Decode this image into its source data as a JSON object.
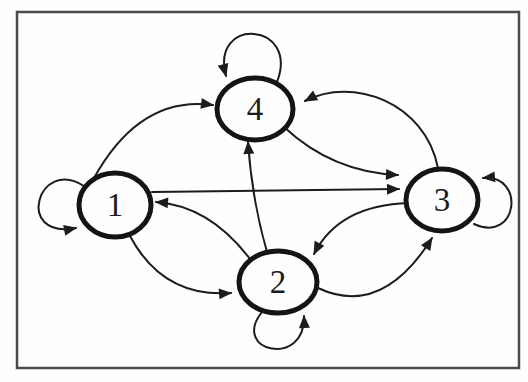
{
  "diagram": {
    "ink_color": "#1c1c1c",
    "node_stroke_color": "#141414",
    "node_fill_color": "#fefefe",
    "frame_color": "#4a4a4a",
    "background_color": "#fefefe",
    "frame": {
      "x": 17,
      "y": 12,
      "width": 502,
      "height": 356
    },
    "nodes": [
      {
        "id": "1",
        "label": "1",
        "cx": 115,
        "cy": 205,
        "rx": 36,
        "ry": 32
      },
      {
        "id": "2",
        "label": "2",
        "cx": 278,
        "cy": 282,
        "rx": 39,
        "ry": 31
      },
      {
        "id": "3",
        "label": "3",
        "cx": 442,
        "cy": 200,
        "rx": 36,
        "ry": 31
      },
      {
        "id": "4",
        "label": "4",
        "cx": 255,
        "cy": 109,
        "rx": 38,
        "ry": 31
      }
    ],
    "edges": [
      {
        "from": "1",
        "to": "1",
        "type": "self-loop",
        "d": "M 84 186 C 38 156, 14 240, 76 228"
      },
      {
        "from": "2",
        "to": "2",
        "type": "self-loop",
        "d": "M 262 312 C 230 352, 306 368, 304 316"
      },
      {
        "from": "3",
        "to": "3",
        "type": "self-loop",
        "d": "M 474 224 C 518 244, 526 174, 483 178"
      },
      {
        "from": "4",
        "to": "4",
        "type": "self-loop",
        "d": "M 277 82 C 300 22, 210 16, 226 76"
      },
      {
        "from": "1",
        "to": "4",
        "type": "arc",
        "d": "M 94 178 Q 140 95, 213 105"
      },
      {
        "from": "1",
        "to": "3",
        "type": "line",
        "d": "M 152 192 L 399 189"
      },
      {
        "from": "1",
        "to": "2",
        "type": "arc",
        "d": "M 130 236 Q 163 298, 231 293"
      },
      {
        "from": "2",
        "to": "1",
        "type": "arc",
        "d": "M 250 259 Q 210 206, 156 202"
      },
      {
        "from": "2",
        "to": "4",
        "type": "arc",
        "d": "M 267 252 Q 252 200, 248 142"
      },
      {
        "from": "2",
        "to": "3",
        "type": "arc",
        "d": "M 318 288 Q 382 318, 432 238"
      },
      {
        "from": "3",
        "to": "2",
        "type": "arc",
        "d": "M 409 203 Q 339 205, 314 254"
      },
      {
        "from": "3",
        "to": "4",
        "type": "arc",
        "d": "M 438 168 C 425 102, 352 76, 305 101"
      },
      {
        "from": "4",
        "to": "3",
        "type": "arc",
        "d": "M 284 127 Q 332 172, 398 175"
      }
    ],
    "style": {
      "edge_stroke_width": 2,
      "node_stroke_width": 5,
      "frame_stroke_width": 2.5,
      "label_font_size": 33
    }
  }
}
